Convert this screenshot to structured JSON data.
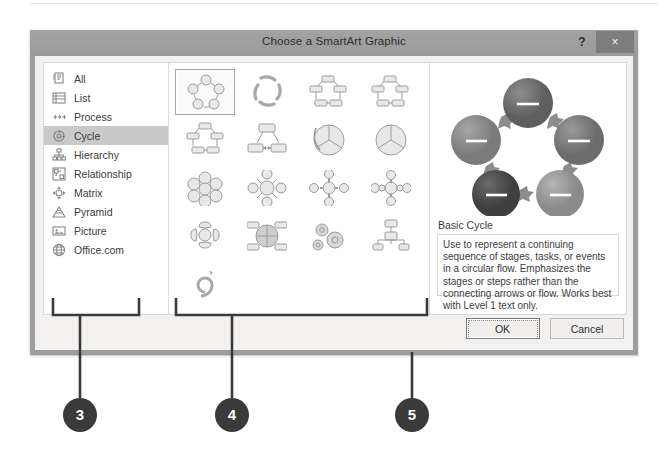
{
  "dialog": {
    "title": "Choose a SmartArt Graphic",
    "help_label": "?",
    "close_label": "×"
  },
  "sidebar": {
    "items": [
      {
        "label": "All",
        "icon": "all-icon",
        "selected": false
      },
      {
        "label": "List",
        "icon": "list-icon",
        "selected": false
      },
      {
        "label": "Process",
        "icon": "process-icon",
        "selected": false
      },
      {
        "label": "Cycle",
        "icon": "cycle-icon",
        "selected": true
      },
      {
        "label": "Hierarchy",
        "icon": "hierarchy-icon",
        "selected": false
      },
      {
        "label": "Relationship",
        "icon": "relationship-icon",
        "selected": false
      },
      {
        "label": "Matrix",
        "icon": "matrix-icon",
        "selected": false
      },
      {
        "label": "Pyramid",
        "icon": "pyramid-icon",
        "selected": false
      },
      {
        "label": "Picture",
        "icon": "picture-icon",
        "selected": false
      },
      {
        "label": "Office.com",
        "icon": "globe-icon",
        "selected": false
      }
    ]
  },
  "gallery": {
    "items": [
      {
        "name": "basic-cycle",
        "shape": "ring-circles",
        "selected": true
      },
      {
        "name": "text-cycle",
        "shape": "ring-arrows",
        "selected": false
      },
      {
        "name": "block-cycle",
        "shape": "ring-boxes",
        "selected": false
      },
      {
        "name": "non-directional-cycle",
        "shape": "ring-boxes2",
        "selected": false
      },
      {
        "name": "continuous-cycle",
        "shape": "ring-boxes3",
        "selected": false
      },
      {
        "name": "segmented-cycle",
        "shape": "tri-boxes",
        "selected": false
      },
      {
        "name": "multidirectional-cycle",
        "shape": "pie-arrows",
        "selected": false
      },
      {
        "name": "basic-pie",
        "shape": "pie",
        "selected": false
      },
      {
        "name": "basic-radial",
        "shape": "honeycomb",
        "selected": false
      },
      {
        "name": "diverging-radial",
        "shape": "radial-diamond",
        "selected": false
      },
      {
        "name": "radial-venn",
        "shape": "radial-cross",
        "selected": false
      },
      {
        "name": "radial-cluster",
        "shape": "radial-cross2",
        "selected": false
      },
      {
        "name": "segmented-pyramid",
        "shape": "radial-lobes",
        "selected": false
      },
      {
        "name": "cycle-matrix",
        "shape": "quad-matrix",
        "selected": false
      },
      {
        "name": "gear",
        "shape": "gears",
        "selected": false
      },
      {
        "name": "hierarchy-cycle",
        "shape": "tree",
        "selected": false
      },
      {
        "name": "spiral-cycle",
        "shape": "spiral",
        "selected": false
      }
    ]
  },
  "preview": {
    "name": "Basic Cycle",
    "description": "Use to represent a continuing sequence of stages, tasks, or events in a circular flow. Emphasizes the stages or steps rather than the connecting arrows or flow. Works best with Level 1 text only."
  },
  "buttons": {
    "ok": "OK",
    "cancel": "Cancel"
  },
  "callouts": [
    {
      "number": "3"
    },
    {
      "number": "4"
    },
    {
      "number": "5"
    }
  ],
  "colors": {
    "titlebar": "#9a9a9a",
    "selection": "#c9c9c9",
    "badge": "#3a3a3a",
    "panel_bg": "#ffffff",
    "client_bg": "#f2f1f0"
  }
}
